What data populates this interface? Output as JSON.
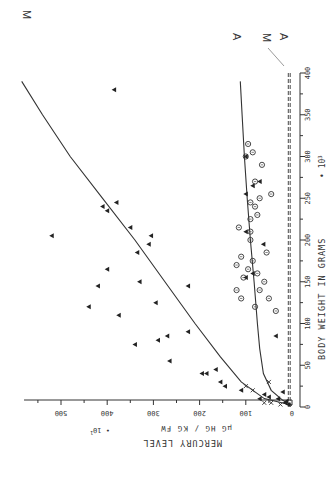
{
  "chart_data": {
    "type": "scatter",
    "orientation": "rotated-90-ccw",
    "title": "",
    "xlabel": "BODY WEIGHT IN GRAMS • 10^3",
    "ylabel": "MERCURY LEVEL",
    "ylabel_units": "µG HG / KG FW",
    "ylabel_multiplier": "• 10^1",
    "xlim": [
      0,
      400
    ],
    "ylim": [
      0,
      580
    ],
    "x_ticks": [
      0,
      50,
      100,
      150,
      200,
      250,
      300,
      350,
      400
    ],
    "x_tick_labels": [
      "0",
      "50",
      "100",
      "150",
      "200",
      "250",
      "300",
      "350",
      "400"
    ],
    "y_ticks": [
      0,
      100,
      200,
      300,
      400,
      500
    ],
    "y_tick_labels": [
      "0",
      "100",
      "200",
      "300",
      "400",
      "500"
    ],
    "grid": false,
    "curve_labels": [
      {
        "name": "M",
        "description": "upper fitted curve (muscle)"
      },
      {
        "name": "A",
        "description": "lower fitted curve"
      },
      {
        "name": "M",
        "description": "dashed baseline near zero"
      },
      {
        "name": "A",
        "description": "dashed baseline near zero"
      }
    ],
    "series": [
      {
        "name": "M",
        "kind": "line",
        "style": "solid",
        "points": [
          [
            2,
            0
          ],
          [
            10,
            60
          ],
          [
            30,
            110
          ],
          [
            60,
            155
          ],
          [
            100,
            210
          ],
          [
            150,
            275
          ],
          [
            200,
            340
          ],
          [
            250,
            410
          ],
          [
            300,
            480
          ],
          [
            350,
            540
          ],
          [
            390,
            585
          ]
        ]
      },
      {
        "name": "A",
        "kind": "line",
        "style": "solid",
        "points": [
          [
            2,
            0
          ],
          [
            8,
            20
          ],
          [
            20,
            45
          ],
          [
            40,
            62
          ],
          [
            70,
            70
          ],
          [
            100,
            75
          ],
          [
            150,
            82
          ],
          [
            200,
            90
          ],
          [
            250,
            97
          ],
          [
            300,
            103
          ],
          [
            350,
            108
          ],
          [
            390,
            112
          ]
        ]
      },
      {
        "name": "M baseline",
        "kind": "line",
        "style": "dashed",
        "points": [
          [
            0,
            8
          ],
          [
            400,
            8
          ]
        ]
      },
      {
        "name": "A baseline",
        "kind": "line",
        "style": "dashed",
        "points": [
          [
            0,
            4
          ],
          [
            400,
            4
          ]
        ]
      },
      {
        "name": "triangles",
        "kind": "marker",
        "marker": "triangle",
        "points": [
          [
            165,
            400
          ],
          [
            195,
            310
          ],
          [
            215,
            350
          ],
          [
            205,
            305
          ],
          [
            145,
            420
          ],
          [
            120,
            440
          ],
          [
            205,
            520
          ],
          [
            125,
            295
          ],
          [
            150,
            330
          ],
          [
            110,
            375
          ],
          [
            80,
            290
          ],
          [
            85,
            270
          ],
          [
            90,
            225
          ],
          [
            145,
            225
          ],
          [
            185,
            335
          ],
          [
            240,
            410
          ],
          [
            235,
            400
          ],
          [
            245,
            380
          ],
          [
            75,
            340
          ],
          [
            55,
            265
          ],
          [
            40,
            195
          ],
          [
            40,
            185
          ],
          [
            30,
            155
          ],
          [
            45,
            165
          ],
          [
            20,
            110
          ],
          [
            25,
            145
          ],
          [
            10,
            70
          ],
          [
            15,
            60
          ],
          [
            12,
            50
          ],
          [
            10,
            30
          ],
          [
            5,
            15
          ],
          [
            3,
            8
          ],
          [
            7,
            12
          ],
          [
            380,
            385
          ],
          [
            300,
            100
          ],
          [
            255,
            100
          ],
          [
            265,
            85
          ],
          [
            270,
            70
          ],
          [
            210,
            100
          ],
          [
            155,
            100
          ],
          [
            160,
            85
          ],
          [
            195,
            62
          ],
          [
            85,
            35
          ],
          [
            18,
            20
          ]
        ]
      },
      {
        "name": "circles",
        "kind": "marker",
        "marker": "circle",
        "points": [
          [
            130,
            50
          ],
          [
            115,
            35
          ],
          [
            140,
            70
          ],
          [
            150,
            60
          ],
          [
            160,
            75
          ],
          [
            175,
            85
          ],
          [
            185,
            55
          ],
          [
            200,
            90
          ],
          [
            210,
            90
          ],
          [
            230,
            75
          ],
          [
            250,
            70
          ],
          [
            255,
            45
          ],
          [
            270,
            80
          ],
          [
            290,
            65
          ],
          [
            300,
            100
          ],
          [
            315,
            95
          ],
          [
            305,
            85
          ],
          [
            245,
            90
          ],
          [
            240,
            80
          ],
          [
            225,
            90
          ],
          [
            215,
            115
          ],
          [
            180,
            110
          ],
          [
            170,
            120
          ],
          [
            165,
            95
          ],
          [
            155,
            105
          ],
          [
            140,
            120
          ],
          [
            130,
            110
          ],
          [
            120,
            80
          ]
        ]
      },
      {
        "name": "crosses",
        "kind": "marker",
        "marker": "x",
        "points": [
          [
            5,
            60
          ],
          [
            3,
            25
          ],
          [
            5,
            45
          ],
          [
            25,
            100
          ],
          [
            30,
            50
          ],
          [
            20,
            85
          ]
        ]
      }
    ]
  },
  "labels": {
    "curve_M_upper": "M",
    "curve_A_upper": "A",
    "curve_M_lower": "M",
    "curve_A_lower": "A",
    "y_axis_title": "MERCURY LEVEL",
    "y_axis_units": "µG HG / KG FW",
    "y_axis_multiplier": "• 10",
    "y_axis_multiplier_exp": "1",
    "x_axis_title": "BODY WEIGHT IN GRAMS",
    "x_axis_multiplier": "• 10",
    "x_axis_multiplier_exp": "3"
  }
}
